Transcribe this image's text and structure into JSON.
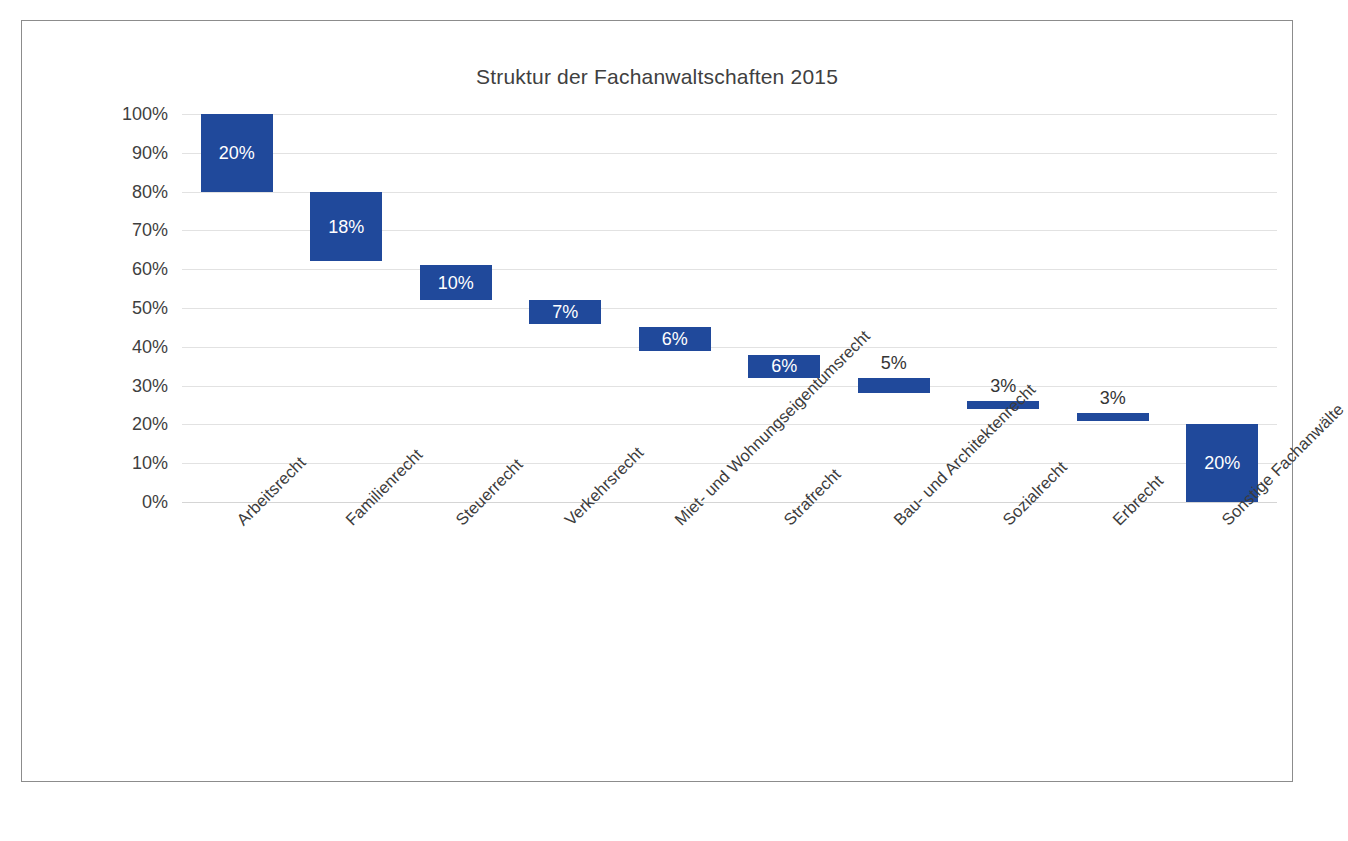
{
  "chart_data": {
    "type": "bar",
    "subtype": "waterfall",
    "title": "Struktur der Fachanwaltschaften 2015",
    "xlabel": "",
    "ylabel": "",
    "ylim": [
      0,
      100
    ],
    "ytick_labels": [
      "100%",
      "90%",
      "80%",
      "70%",
      "60%",
      "50%",
      "40%",
      "30%",
      "20%",
      "10%",
      "0%"
    ],
    "ytick_values": [
      100,
      90,
      80,
      70,
      60,
      50,
      40,
      30,
      20,
      10,
      0
    ],
    "grid": true,
    "legend": "none",
    "bar_color": "#20499B",
    "categories": [
      "Arbeitsrecht",
      "Familienrecht",
      "Steuerrecht",
      "Verkehrsrecht",
      "Miet- und Wohnungseigentumsrecht",
      "Strafrecht",
      "Bau- und Architektenrecht",
      "Sozialrecht",
      "Erbrecht",
      "Sonstige Fachanwälte"
    ],
    "values": [
      20,
      18,
      10,
      7,
      6,
      6,
      5,
      3,
      3,
      20
    ],
    "value_labels": [
      "20%",
      "18%",
      "10%",
      "7%",
      "6%",
      "6%",
      "5%",
      "3%",
      "3%",
      "20%"
    ],
    "label_positions": [
      "inside",
      "inside",
      "inside",
      "inside",
      "inside",
      "inside",
      "outside",
      "outside",
      "outside",
      "inside"
    ],
    "segments": [
      {
        "category": "Arbeitsrecht",
        "label": "20%",
        "value": 20,
        "top": 100,
        "bottom": 80
      },
      {
        "category": "Familienrecht",
        "label": "18%",
        "value": 18,
        "top": 80,
        "bottom": 62
      },
      {
        "category": "Steuerrecht",
        "label": "10%",
        "value": 10,
        "top": 61,
        "bottom": 52
      },
      {
        "category": "Verkehrsrecht",
        "label": "7%",
        "value": 7,
        "top": 52,
        "bottom": 46
      },
      {
        "category": "Miet- und Wohnungseigentumsrecht",
        "label": "6%",
        "value": 6,
        "top": 45,
        "bottom": 39
      },
      {
        "category": "Strafrecht",
        "label": "6%",
        "value": 6,
        "top": 38,
        "bottom": 32
      },
      {
        "category": "Bau- und Architektenrecht",
        "label": "5%",
        "value": 5,
        "top": 32,
        "bottom": 28
      },
      {
        "category": "Sozialrecht",
        "label": "3%",
        "value": 3,
        "top": 26,
        "bottom": 24
      },
      {
        "category": "Erbrecht",
        "label": "3%",
        "value": 3,
        "top": 23,
        "bottom": 21
      },
      {
        "category": "Sonstige Fachanwälte",
        "label": "20%",
        "value": 20,
        "top": 20,
        "bottom": 0
      }
    ]
  }
}
